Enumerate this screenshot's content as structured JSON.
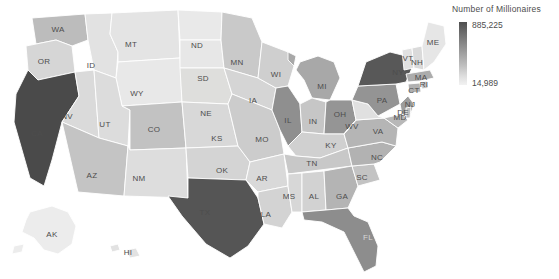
{
  "legend": {
    "title": "Number of Millionaires",
    "max_label": "885,225",
    "min_label": "14,989",
    "gradient_top_color": "#4f4f4f",
    "gradient_bottom_color": "#f2f2f2"
  },
  "map": {
    "background_color": "#ffffff",
    "border_color": "#ffffff",
    "label_color": "#4d4d4d"
  },
  "chart_data": {
    "type": "choropleth",
    "title": "Number of Millionaires",
    "value_label": "Number of Millionaires",
    "colorbar": {
      "min": 14989,
      "max": 885225,
      "scale": "grayscale-sequential"
    },
    "regions": [
      {
        "code": "CA",
        "value": 885225,
        "fill": "#4a4a4a",
        "label_x": 37,
        "label_y": 133,
        "label_light": false
      },
      {
        "code": "TX",
        "value": 690000,
        "fill": "#555555",
        "label_x": 205,
        "label_y": 212,
        "label_light": false
      },
      {
        "code": "NY",
        "value": 660000,
        "fill": "#585858",
        "label_x": 398,
        "label_y": 72,
        "label_light": false
      },
      {
        "code": "FL",
        "value": 470000,
        "fill": "#8d8d8d",
        "label_x": 368,
        "label_y": 237,
        "label_light": true
      },
      {
        "code": "IL",
        "value": 440000,
        "fill": "#8f8f8f",
        "label_x": 288,
        "label_y": 120,
        "label_light": false
      },
      {
        "code": "OH",
        "value": 370000,
        "fill": "#959595",
        "label_x": 340,
        "label_y": 114,
        "label_light": false
      },
      {
        "code": "PA",
        "value": 360000,
        "fill": "#949494",
        "label_x": 382,
        "label_y": 100,
        "label_light": false
      },
      {
        "code": "MI",
        "value": 300000,
        "fill": "#a8a8a8",
        "label_x": 322,
        "label_y": 86,
        "label_light": false
      },
      {
        "code": "NJ",
        "value": 280000,
        "fill": "#9d9d9d",
        "label_x": 410,
        "label_y": 104,
        "label_light": false
      },
      {
        "code": "GA",
        "value": 250000,
        "fill": "#b4b4b4",
        "label_x": 342,
        "label_y": 196,
        "label_light": false
      },
      {
        "code": "NC",
        "value": 240000,
        "fill": "#b2b2b2",
        "label_x": 377,
        "label_y": 157,
        "label_light": false
      },
      {
        "code": "VA",
        "value": 240000,
        "fill": "#b5b5b5",
        "label_x": 378,
        "label_y": 131,
        "label_light": false
      },
      {
        "code": "MA",
        "value": 230000,
        "fill": "#acacac",
        "label_x": 421,
        "label_y": 77,
        "label_light": false
      },
      {
        "code": "WA",
        "value": 220000,
        "fill": "#bcbcbc",
        "label_x": 58,
        "label_y": 29,
        "label_light": false
      },
      {
        "code": "CO",
        "value": 200000,
        "fill": "#c2c2c2",
        "label_x": 154,
        "label_y": 129,
        "label_light": false
      },
      {
        "code": "AZ",
        "value": 195000,
        "fill": "#c4c4c4",
        "label_x": 92,
        "label_y": 175,
        "label_light": false
      },
      {
        "code": "IN",
        "value": 180000,
        "fill": "#c6c6c6",
        "label_x": 313,
        "label_y": 121,
        "label_light": false
      },
      {
        "code": "MN",
        "value": 180000,
        "fill": "#c9c9c9",
        "label_x": 237,
        "label_y": 62,
        "label_light": false
      },
      {
        "code": "MD",
        "value": 175000,
        "fill": "#b8b8b8",
        "label_x": 400,
        "label_y": 117,
        "label_light": false
      },
      {
        "code": "WI",
        "value": 170000,
        "fill": "#cfcfcf",
        "label_x": 276,
        "label_y": 74,
        "label_light": false
      },
      {
        "code": "MO",
        "value": 165000,
        "fill": "#cccccc",
        "label_x": 262,
        "label_y": 139,
        "label_light": false
      },
      {
        "code": "TN",
        "value": 160000,
        "fill": "#c8c8c8",
        "label_x": 312,
        "label_y": 163,
        "label_light": false
      },
      {
        "code": "SC",
        "value": 145000,
        "fill": "#c3c3c3",
        "label_x": 362,
        "label_y": 177,
        "label_light": false
      },
      {
        "code": "AL",
        "value": 130000,
        "fill": "#d2d2d2",
        "label_x": 314,
        "label_y": 196,
        "label_light": false
      },
      {
        "code": "CT",
        "value": 130000,
        "fill": "#b0b0b0",
        "label_x": 414,
        "label_y": 90,
        "label_light": false
      },
      {
        "code": "OR",
        "value": 125000,
        "fill": "#d6d6d6",
        "label_x": 44,
        "label_y": 61,
        "label_light": false
      },
      {
        "code": "LA",
        "value": 120000,
        "fill": "#d3d3d3",
        "label_x": 266,
        "label_y": 214,
        "label_light": false
      },
      {
        "code": "KY",
        "value": 120000,
        "fill": "#d0d0d0",
        "label_x": 331,
        "label_y": 145,
        "label_light": false
      },
      {
        "code": "OK",
        "value": 115000,
        "fill": "#d4d4d4",
        "label_x": 222,
        "label_y": 170,
        "label_light": false
      },
      {
        "code": "IA",
        "value": 110000,
        "fill": "#d5d5d5",
        "label_x": 253,
        "label_y": 100,
        "label_light": false
      },
      {
        "code": "KS",
        "value": 105000,
        "fill": "#d8d8d8",
        "label_x": 217,
        "label_y": 138,
        "label_light": false
      },
      {
        "code": "NV",
        "value": 100000,
        "fill": "#dadada",
        "label_x": 67,
        "label_y": 116,
        "label_light": false
      },
      {
        "code": "UT",
        "value": 95000,
        "fill": "#dcdcdc",
        "label_x": 105,
        "label_y": 124,
        "label_light": false
      },
      {
        "code": "AR",
        "value": 90000,
        "fill": "#d9d9d9",
        "label_x": 262,
        "label_y": 178,
        "label_light": false
      },
      {
        "code": "MS",
        "value": 88000,
        "fill": "#d7d7d7",
        "label_x": 289,
        "label_y": 196,
        "label_light": false
      },
      {
        "code": "NM",
        "value": 80000,
        "fill": "#dddddd",
        "label_x": 139,
        "label_y": 178,
        "label_light": false
      },
      {
        "code": "NE",
        "value": 78000,
        "fill": "#dededc",
        "label_x": 206,
        "label_y": 113,
        "label_light": false
      },
      {
        "code": "WV",
        "value": 70000,
        "fill": "#e0e0e0",
        "label_x": 352,
        "label_y": 126,
        "label_light": false
      },
      {
        "code": "ID",
        "value": 65000,
        "fill": "#e2e2e2",
        "label_x": 91,
        "label_y": 65,
        "label_light": false
      },
      {
        "code": "NH",
        "value": 60000,
        "fill": "#dadada",
        "label_x": 417,
        "label_y": 62,
        "label_light": false
      },
      {
        "code": "ME",
        "value": 55000,
        "fill": "#e6e6e6",
        "label_x": 433,
        "label_y": 42,
        "label_light": false
      },
      {
        "code": "RI",
        "value": 52000,
        "fill": "#c0c0c0",
        "label_x": 424,
        "label_y": 84,
        "label_light": false
      },
      {
        "code": "MT",
        "value": 50000,
        "fill": "#e4e4e4",
        "label_x": 131,
        "label_y": 44,
        "label_light": false
      },
      {
        "code": "DE",
        "value": 48000,
        "fill": "#bfbfbf",
        "label_x": 403,
        "label_y": 112,
        "label_light": false
      },
      {
        "code": "HI",
        "value": 45000,
        "fill": "#e2e2e2",
        "label_x": 128,
        "label_y": 252,
        "label_light": false
      },
      {
        "code": "SD",
        "value": 40000,
        "fill": "#e7e7e7",
        "label_x": 203,
        "label_y": 78,
        "label_light": false
      },
      {
        "code": "ND",
        "value": 35000,
        "fill": "#e9e9e9",
        "label_x": 197,
        "label_y": 45,
        "label_light": false
      },
      {
        "code": "AK",
        "value": 30000,
        "fill": "#ececec",
        "label_x": 52,
        "label_y": 234,
        "label_light": false
      },
      {
        "code": "VT",
        "value": 28000,
        "fill": "#e1e1e1",
        "label_x": 408,
        "label_y": 58,
        "label_light": false
      },
      {
        "code": "WY",
        "value": 14989,
        "fill": "#e8e8e8",
        "label_x": 137,
        "label_y": 93,
        "label_light": false
      }
    ]
  }
}
